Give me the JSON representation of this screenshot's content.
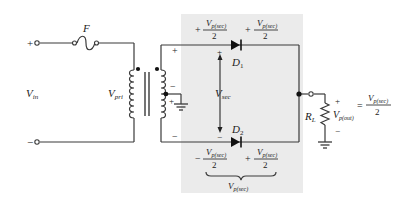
{
  "diagram": {
    "type": "center-tapped full-wave rectifier circuit",
    "colors": {
      "wire": "#3a3a3a",
      "shade": "#ebebeb",
      "background": "#ffffff",
      "text": "#222222"
    },
    "input": {
      "plus_label": "+",
      "minus_label": "−",
      "voltage_label": "V",
      "voltage_sub": "in"
    },
    "fuse": {
      "label": "F"
    },
    "transformer": {
      "primary_label": "V",
      "primary_sub": "pri",
      "secondary_top_plus": "+",
      "center_minus": "−",
      "center_plus": "+",
      "secondary_bottom_minus": "−"
    },
    "secondary": {
      "label": "V",
      "label_sub": "sec",
      "top_plus": "+",
      "bottom_minus": "−"
    },
    "diodes": [
      {
        "label": "D",
        "sub": "1"
      },
      {
        "label": "D",
        "sub": "2"
      }
    ],
    "top_annotation": {
      "left_sign": "+",
      "left_num": "V",
      "left_num_sub": "p(sec)",
      "left_den": "2",
      "right_sign": "+",
      "right_num": "V",
      "right_num_sub": "p(sec)",
      "right_den": "2"
    },
    "bottom_annotation": {
      "left_sign": "−",
      "left_num": "V",
      "left_num_sub": "p(sec)",
      "left_den": "2",
      "right_sign": "+",
      "right_num": "V",
      "right_num_sub": "p(sec)",
      "right_den": "2",
      "brace_label": "V",
      "brace_label_sub": "p(sec)"
    },
    "load": {
      "resistor_label": "R",
      "resistor_sub": "L",
      "plus": "+",
      "minus": "−",
      "output_label": "V",
      "output_sub": "p(out)",
      "equals": "=",
      "rhs_num": "V",
      "rhs_num_sub": "p(sec)",
      "rhs_den": "2"
    }
  }
}
